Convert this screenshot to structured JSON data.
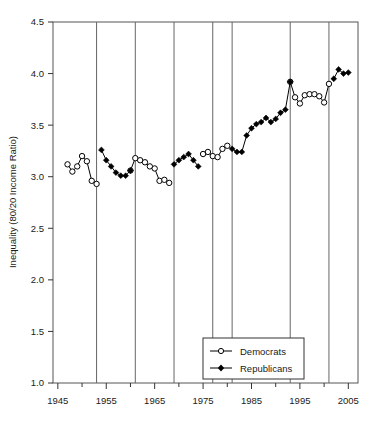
{
  "chart_data": {
    "type": "line",
    "title": "",
    "xlabel": "",
    "ylabel": "Inequality (80/20 Income Ratio)",
    "xlim": [
      1944,
      2007
    ],
    "ylim": [
      1.0,
      4.5
    ],
    "grid": "vertical-only",
    "legend_position": "bottom-center-right",
    "x_ticks_major": [
      1945,
      1955,
      1965,
      1975,
      1985,
      1995,
      2005
    ],
    "x_ticks_major_labels": [
      "1945",
      "1955",
      "1965",
      "1975",
      "1985",
      "1995",
      "2005"
    ],
    "x_ticks_minor": [
      1950,
      1960,
      1970,
      1980,
      1990,
      2000
    ],
    "y_ticks": [
      1.0,
      1.5,
      2.0,
      2.5,
      3.0,
      3.5,
      4.0,
      4.5
    ],
    "y_tick_labels": [
      "1.0",
      "1.5",
      "2.0",
      "2.5",
      "3.0",
      "3.5",
      "4.0",
      "4.5"
    ],
    "party_change_years": [
      1953,
      1961,
      1969,
      1977,
      1981,
      1993,
      2001
    ],
    "series": [
      {
        "name": "Democrats",
        "marker": "open-circle",
        "color": "#000000",
        "points": [
          [
            1947,
            3.12
          ],
          [
            1948,
            3.05
          ],
          [
            1949,
            3.1
          ],
          [
            1950,
            3.2
          ],
          [
            1951,
            3.15
          ],
          [
            1952,
            2.96
          ],
          [
            1953,
            2.93
          ],
          [
            1960,
            3.06
          ],
          [
            1961,
            3.18
          ],
          [
            1962,
            3.16
          ],
          [
            1963,
            3.14
          ],
          [
            1964,
            3.1
          ],
          [
            1965,
            3.08
          ],
          [
            1966,
            2.96
          ],
          [
            1967,
            2.97
          ],
          [
            1968,
            2.94
          ],
          [
            1975,
            3.22
          ],
          [
            1976,
            3.24
          ],
          [
            1977,
            3.2
          ],
          [
            1978,
            3.19
          ],
          [
            1979,
            3.27
          ],
          [
            1980,
            3.3
          ],
          [
            1993,
            3.92
          ],
          [
            1994,
            3.77
          ],
          [
            1995,
            3.71
          ],
          [
            1996,
            3.79
          ],
          [
            1997,
            3.8
          ],
          [
            1998,
            3.8
          ],
          [
            1999,
            3.78
          ],
          [
            2000,
            3.72
          ],
          [
            2001,
            3.9
          ]
        ]
      },
      {
        "name": "Republicans",
        "marker": "filled-diamond",
        "color": "#000000",
        "points": [
          [
            1954,
            3.26
          ],
          [
            1955,
            3.16
          ],
          [
            1956,
            3.1
          ],
          [
            1957,
            3.04
          ],
          [
            1958,
            3.01
          ],
          [
            1959,
            3.01
          ],
          [
            1960,
            3.06
          ],
          [
            1969,
            3.12
          ],
          [
            1970,
            3.16
          ],
          [
            1971,
            3.19
          ],
          [
            1972,
            3.22
          ],
          [
            1973,
            3.16
          ],
          [
            1974,
            3.1
          ],
          [
            1981,
            3.27
          ],
          [
            1982,
            3.24
          ],
          [
            1983,
            3.24
          ],
          [
            1984,
            3.4
          ],
          [
            1985,
            3.47
          ],
          [
            1986,
            3.51
          ],
          [
            1987,
            3.53
          ],
          [
            1988,
            3.57
          ],
          [
            1989,
            3.53
          ],
          [
            1990,
            3.56
          ],
          [
            1991,
            3.62
          ],
          [
            1992,
            3.65
          ],
          [
            1993,
            3.92
          ],
          [
            2002,
            3.95
          ],
          [
            2003,
            4.04
          ],
          [
            2004,
            4.0
          ],
          [
            2005,
            4.01
          ]
        ]
      }
    ]
  },
  "legend": {
    "items": [
      {
        "label": "Democrats",
        "marker": "open-circle"
      },
      {
        "label": "Republicans",
        "marker": "filled-diamond"
      }
    ]
  }
}
